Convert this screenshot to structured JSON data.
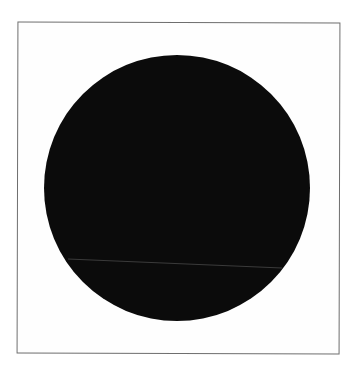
{
  "image": {
    "background_color": "#ffffff",
    "frame": {
      "border_color": "#6e6e6e"
    },
    "circle": {
      "fill_color": "#0b0b0b",
      "center_x": 177,
      "center_y": 188,
      "radius": 133
    },
    "line": {
      "color": "#5a5a5a",
      "x1": 68,
      "y1": 259,
      "x2": 282,
      "y2": 268
    }
  }
}
